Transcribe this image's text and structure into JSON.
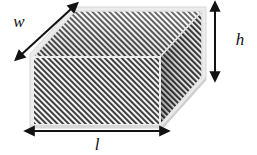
{
  "figure": {
    "shape_name": "rectangular-prism",
    "background_color": "#ffffff",
    "hatch_color": "#3c3c3c",
    "hatch_background": "#ffffff",
    "edge_color": "#e8e8e8",
    "outline_color": "#cfcfcf",
    "arrow_color": "#121212",
    "label_color": "#121212"
  },
  "labels": {
    "width": "w",
    "height": "h",
    "length": "l"
  },
  "dimensions": [
    {
      "key": "width",
      "label": "w",
      "meaning": "depth of prism",
      "arrow": "double-headed",
      "orientation": "diagonal-up-right",
      "from": [
        22,
        54
      ],
      "to": [
        71,
        9
      ],
      "label_position": [
        19,
        27
      ]
    },
    {
      "key": "height",
      "label": "h",
      "meaning": "height of prism",
      "arrow": "double-headed",
      "orientation": "vertical",
      "from": [
        215,
        10
      ],
      "to": [
        215,
        73
      ],
      "label_position": [
        240,
        45
      ]
    },
    {
      "key": "length",
      "label": "l",
      "meaning": "length of prism",
      "arrow": "double-headed",
      "orientation": "horizontal",
      "from": [
        33,
        131
      ],
      "to": [
        161,
        131
      ],
      "label_position": [
        97,
        149
      ]
    }
  ],
  "faces": [
    {
      "name": "front-face",
      "shape": "rectangle",
      "fill": "diagonal-hatch",
      "points": "33,57 160,57 160,125 33,125"
    },
    {
      "name": "top-face",
      "shape": "parallelogram",
      "fill": "diagonal-hatch",
      "points": "33,57 75,11 202,11 160,57"
    },
    {
      "name": "right-face",
      "shape": "parallelogram",
      "fill": "diagonal-hatch-shaded",
      "points": "160,57 202,11 202,77 160,125"
    }
  ],
  "icons": {
    "arrow_head": "arrow-head-triangle"
  }
}
